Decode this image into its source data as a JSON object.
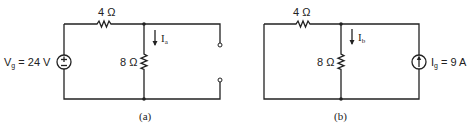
{
  "circuit_a": {
    "caption": "(a)",
    "series_resistor": "4 Ω",
    "shunt_resistor": "8 Ω",
    "source_label_main": "V",
    "source_label_sub": "g",
    "source_value": " = 24 V",
    "current_label_main": "I",
    "current_label_sub": "a",
    "source_type": "voltage-source",
    "output": "open terminals"
  },
  "circuit_b": {
    "caption": "(b)",
    "series_resistor": "4 Ω",
    "shunt_resistor": "8 Ω",
    "source_label_main": "I",
    "source_label_sub": "g",
    "source_value": " = 9 A",
    "current_label_main": "I",
    "current_label_sub": "b",
    "source_type": "current-source"
  }
}
